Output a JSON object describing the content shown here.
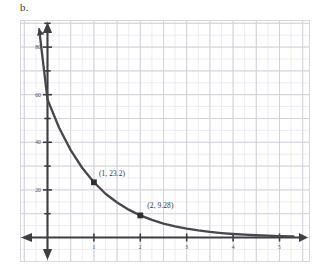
{
  "part_label": "b.",
  "chart_data": {
    "type": "line",
    "title": "",
    "subtitle": "",
    "xlabel": "",
    "ylabel": "",
    "xlim": [
      -0.45,
      5.7
    ],
    "ylim": [
      -12,
      97
    ],
    "grid": true,
    "legend": null,
    "function": "y = 58 * 0.4^x",
    "series": [
      {
        "name": "exponential decay curve",
        "x": [
          -0.18,
          0,
          0.25,
          0.5,
          0.75,
          1,
          1.25,
          1.5,
          1.75,
          2,
          2.25,
          2.5,
          2.75,
          3,
          3.25,
          3.5,
          3.75,
          4,
          4.25,
          4.5,
          4.75,
          5,
          5.3
        ],
        "y": [
          87.5,
          58,
          46.1,
          36.7,
          29.2,
          23.2,
          18.4,
          14.7,
          11.7,
          9.28,
          7.38,
          5.87,
          4.67,
          3.71,
          2.95,
          2.35,
          1.87,
          1.48,
          1.18,
          0.94,
          0.75,
          0.59,
          0.44
        ]
      }
    ],
    "labeled_points": [
      {
        "x": 1,
        "y": 23.2,
        "label": "(1, 23.2)"
      },
      {
        "x": 2,
        "y": 9.28,
        "label": "(2, 9.28)"
      }
    ],
    "x_ticks": [
      {
        "value": 1,
        "label": "1"
      },
      {
        "value": 2,
        "label": "2"
      },
      {
        "value": 3,
        "label": "3"
      },
      {
        "value": 4,
        "label": "4"
      },
      {
        "value": 5,
        "label": "5"
      }
    ],
    "y_ticks": [
      {
        "value": 20,
        "label": "20"
      },
      {
        "value": 40,
        "label": "40"
      },
      {
        "value": 60,
        "label": "60"
      },
      {
        "value": 80,
        "label": "80"
      }
    ],
    "y_minor_ticks": [
      10,
      30,
      50,
      70,
      90
    ],
    "axis_arrows": [
      "left",
      "right",
      "up",
      "down"
    ],
    "colors": {
      "curve": "#47474d",
      "axis": "#3d3d42",
      "grid_major": "#cfcfd8",
      "grid_minor": "#e9e9ee",
      "frame": "#d8d8da",
      "text": "#4a4a50",
      "point_marker": "#2f2f34"
    }
  }
}
